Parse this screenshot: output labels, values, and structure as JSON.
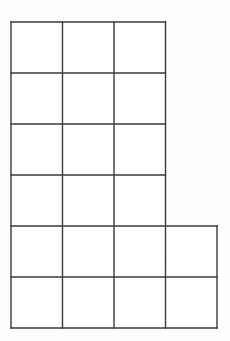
{
  "figure": {
    "kind": "grid-outline-figure",
    "top_text_fragment": "··  ·   ––  ––   –",
    "colors": {
      "background": "#fdfdfd",
      "grid_line": "#3a3a3a",
      "outline": "#2b2b2b"
    },
    "geometry": {
      "left": 11,
      "top": 22,
      "cell_width": 51.5,
      "cell_height": 51,
      "columns_total": 4,
      "rows_total": 6,
      "x_lines": [
        11,
        62.5,
        114,
        165.5,
        217
      ],
      "y_lines": [
        22,
        73,
        124,
        175,
        226,
        277,
        328
      ],
      "line_width": 1.4
    },
    "rows": [
      {
        "index": 1,
        "cells": 3,
        "cell_labels": [
          "",
          "",
          ""
        ]
      },
      {
        "index": 2,
        "cells": 3,
        "cell_labels": [
          "",
          "",
          ""
        ]
      },
      {
        "index": 3,
        "cells": 3,
        "cell_labels": [
          "",
          "",
          ""
        ]
      },
      {
        "index": 4,
        "cells": 3,
        "cell_labels": [
          "",
          "",
          ""
        ]
      },
      {
        "index": 5,
        "cells": 4,
        "cell_labels": [
          "",
          "",
          "",
          ""
        ]
      },
      {
        "index": 6,
        "cells": 4,
        "cell_labels": [
          "",
          "",
          "",
          ""
        ]
      }
    ],
    "total_cells": 20
  }
}
